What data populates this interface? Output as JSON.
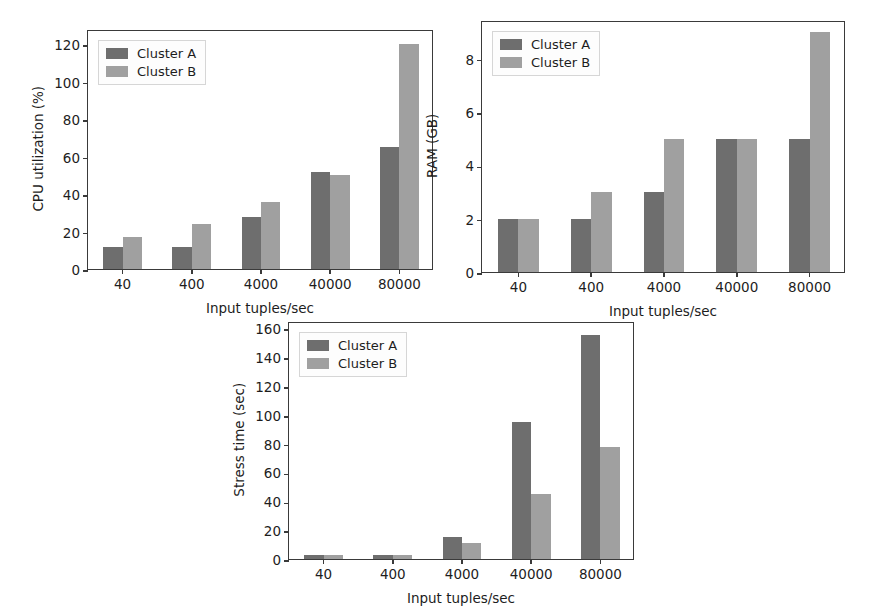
{
  "figure": {
    "background": "#ffffff",
    "axis_color": "#3a3a3a",
    "text_color": "#1d1d1d"
  },
  "series_colors": {
    "cluster_a": "#6e6e6e",
    "cluster_b": "#a0a0a0"
  },
  "legend": {
    "cluster_a_label": "Cluster A",
    "cluster_b_label": "Cluster B"
  },
  "chart_data": [
    {
      "id": "cpu",
      "type": "bar",
      "title": "",
      "xlabel": "Input tuples/sec",
      "ylabel": "CPU utilization (%)",
      "categories": [
        "40",
        "400",
        "4000",
        "40000",
        "80000"
      ],
      "series": [
        {
          "name": "Cluster A",
          "values": [
            12,
            12,
            28,
            52,
            65
          ]
        },
        {
          "name": "Cluster B",
          "values": [
            17,
            24,
            36,
            50,
            120
          ]
        }
      ],
      "yticks": [
        0,
        20,
        40,
        60,
        80,
        100,
        120
      ],
      "ytick_labels": [
        "0",
        "20",
        "40",
        "60",
        "80",
        "100",
        "120"
      ],
      "ylim": [
        0,
        128
      ],
      "grid": false,
      "legend_position": "upper left"
    },
    {
      "id": "ram",
      "type": "bar",
      "title": "",
      "xlabel": "Input tuples/sec",
      "ylabel": "RAM (GB)",
      "categories": [
        "40",
        "400",
        "4000",
        "40000",
        "80000"
      ],
      "series": [
        {
          "name": "Cluster A",
          "values": [
            2,
            2,
            3,
            5,
            5
          ]
        },
        {
          "name": "Cluster B",
          "values": [
            2,
            3,
            5,
            5,
            9
          ]
        }
      ],
      "yticks": [
        0,
        2,
        4,
        6,
        8
      ],
      "ytick_labels": [
        "0",
        "2",
        "4",
        "6",
        "8"
      ],
      "ylim": [
        0,
        9.45
      ],
      "grid": false,
      "legend_position": "upper left"
    },
    {
      "id": "stress",
      "type": "bar",
      "title": "",
      "xlabel": "Input tuples/sec",
      "ylabel": "Stress time (sec)",
      "categories": [
        "40",
        "400",
        "4000",
        "40000",
        "80000"
      ],
      "series": [
        {
          "name": "Cluster A",
          "values": [
            2.5,
            2.5,
            15,
            95,
            155
          ]
        },
        {
          "name": "Cluster B",
          "values": [
            2.5,
            2.5,
            11,
            45,
            78
          ]
        }
      ],
      "yticks": [
        0,
        20,
        40,
        60,
        80,
        100,
        120,
        140,
        160
      ],
      "ytick_labels": [
        "0",
        "20",
        "40",
        "60",
        "80",
        "100",
        "120",
        "140",
        "160"
      ],
      "ylim": [
        0,
        165
      ],
      "grid": false,
      "legend_position": "upper left"
    }
  ],
  "panels": [
    {
      "id": "cpu",
      "left": 87,
      "top": 30,
      "width": 346,
      "height": 240
    },
    {
      "id": "ram",
      "left": 481,
      "top": 21,
      "width": 364,
      "height": 252
    },
    {
      "id": "stress",
      "left": 288,
      "top": 322,
      "width": 346,
      "height": 238
    }
  ]
}
